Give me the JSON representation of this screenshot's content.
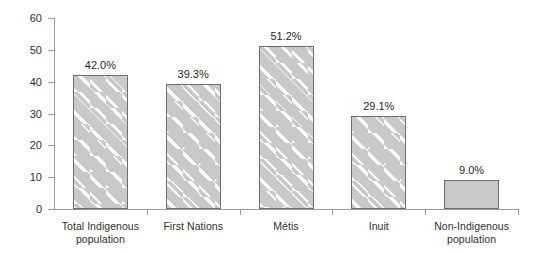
{
  "chart_data": {
    "type": "bar",
    "title": "",
    "subtitle": "",
    "xlabel": "",
    "ylabel": "Per cent",
    "ylim": [
      0,
      60
    ],
    "yticks": [
      0,
      10,
      20,
      30,
      40,
      50,
      60
    ],
    "ytick_labels": [
      "0",
      "10",
      "20",
      "30",
      "40",
      "50",
      "60"
    ],
    "grid": false,
    "legend": null,
    "categories": [
      "Total Indigenous population",
      "First Nations",
      "Métis",
      "Inuit",
      "Non-Indigenous population"
    ],
    "category_label_lines": [
      [
        "Total Indigenous",
        "population"
      ],
      [
        "First Nations"
      ],
      [
        "Métis"
      ],
      [
        "Inuit"
      ],
      [
        "Non-Indigenous",
        "population"
      ]
    ],
    "values": [
      42.0,
      39.3,
      51.2,
      29.1,
      9.0
    ],
    "data_labels": [
      "42.0%",
      "39.3%",
      "51.2%",
      "29.1%",
      "9.0%"
    ],
    "bar_fill_styles": [
      "hatched",
      "hatched",
      "hatched",
      "hatched",
      "solid"
    ],
    "colors": {
      "bar_fill": "#c9c9c9",
      "bar_border": "#6e6e6e",
      "hatch": "#ffffff",
      "axis": "#9a9a9a",
      "text": "#2f2f2f",
      "background": "#ffffff"
    }
  }
}
